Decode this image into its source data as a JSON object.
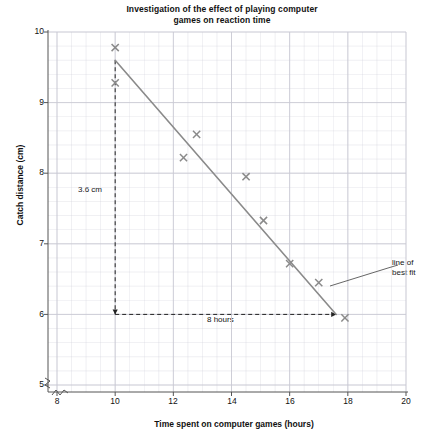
{
  "chart_data": {
    "type": "scatter",
    "title": "Investigation of the effect of playing computer games on reaction time",
    "title_line1": "Investigation of the effect of playing computer",
    "title_line2": "games on reaction time",
    "xlabel": "Time spent on computer games (hours)",
    "ylabel": "Catch distance (cm)",
    "xlim": [
      7.4,
      20
    ],
    "ylim": [
      4.8,
      10
    ],
    "xticks": [
      8,
      10,
      12,
      14,
      16,
      18,
      20
    ],
    "xtick_labels": [
      "8",
      "10",
      "12",
      "14",
      "16",
      "18",
      "20"
    ],
    "yticks": [
      5,
      6,
      7,
      8,
      9,
      10
    ],
    "ytick_labels": [
      "5",
      "6",
      "7",
      "8",
      "9",
      "10"
    ],
    "x_minor_step": 0.5,
    "y_minor_step": 0.2,
    "grid": true,
    "axis_break_x": true,
    "axis_break_y": true,
    "legend": "none",
    "marker": "x",
    "marker_color": "#8a8a8a",
    "line_color": "#8a8a8a",
    "grid_color": "#c9c9d4",
    "points": [
      {
        "x": 10.0,
        "y": 9.78
      },
      {
        "x": 10.0,
        "y": 9.28
      },
      {
        "x": 12.35,
        "y": 8.22
      },
      {
        "x": 12.8,
        "y": 8.55
      },
      {
        "x": 14.5,
        "y": 7.95
      },
      {
        "x": 15.1,
        "y": 7.33
      },
      {
        "x": 16.0,
        "y": 6.72
      },
      {
        "x": 17.0,
        "y": 6.45
      },
      {
        "x": 17.9,
        "y": 5.95
      }
    ],
    "best_fit_line": {
      "label": "line of best fit",
      "label_line1": "line of",
      "label_line2": "best fit",
      "x1": 10.0,
      "y1": 9.6,
      "x2": 17.6,
      "y2": 6.0
    },
    "gradient_triangle": {
      "rise_label": "3.6 cm",
      "run_label": "8 hours",
      "rise": 3.6,
      "run": 8,
      "vertical_x": 10.0,
      "vertical_y_top": 9.6,
      "vertical_y_bottom": 6.0,
      "horizontal_y": 6.0,
      "horizontal_x_left": 10.0,
      "horizontal_x_right": 17.6
    }
  }
}
